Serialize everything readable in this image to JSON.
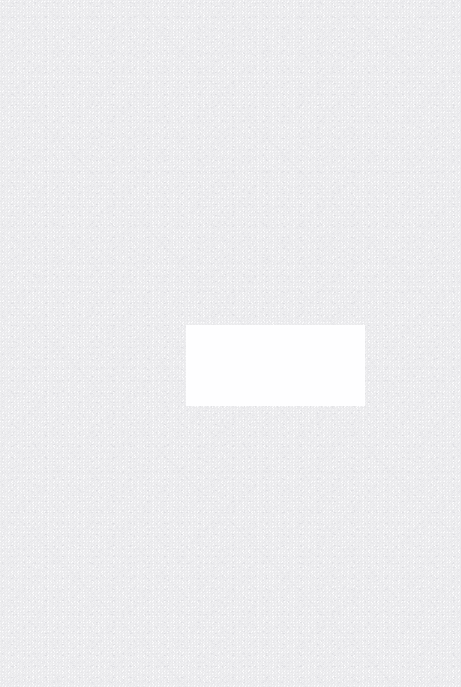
{
  "canvas": {
    "width": 461,
    "height": 687,
    "base_color": "#fcfcfd"
  },
  "background": {
    "texture": "fine-speckle-noise",
    "speckle_colors": [
      "#e8e8ea",
      "#eeeef1",
      "#f2f2f5",
      "#e3e3e7",
      "#dedee2",
      "#d9d9de"
    ],
    "uniform": true
  },
  "blank_panel": {
    "fill_color": "#fefeff",
    "left": 186,
    "top": 325,
    "width": 179,
    "height": 81
  }
}
